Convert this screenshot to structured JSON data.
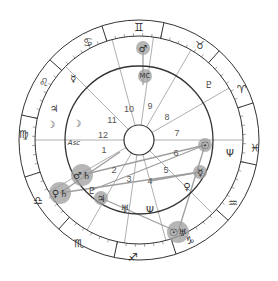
{
  "chart": {
    "center": [
      139,
      140
    ],
    "radii": {
      "outer": 120,
      "zodiac_inner": 104,
      "house": 74,
      "inner": 15
    },
    "colors": {
      "ring": "#333333",
      "house_line": "#9a9a9a",
      "aspect": "#9e9e9e",
      "highlight": "#9e9e9e",
      "glyph": "#333333"
    }
  },
  "zodiac": [
    {
      "name": "gemini",
      "glyph": "♊",
      "x": 139,
      "y": 27
    },
    {
      "name": "taurus",
      "glyph": "♉",
      "x": 200,
      "y": 45
    },
    {
      "name": "aries",
      "glyph": "♈",
      "x": 242,
      "y": 89
    },
    {
      "name": "pisces",
      "glyph": "♓",
      "x": 255,
      "y": 148
    },
    {
      "name": "aquarius",
      "glyph": "♒",
      "x": 233,
      "y": 203
    },
    {
      "name": "capricorn",
      "glyph": "♑",
      "x": 190,
      "y": 240
    },
    {
      "name": "sagittarius",
      "glyph": "♐",
      "x": 133,
      "y": 257
    },
    {
      "name": "scorpio",
      "glyph": "♏",
      "x": 79,
      "y": 243
    },
    {
      "name": "libra",
      "glyph": "♎",
      "x": 38,
      "y": 200
    },
    {
      "name": "virgo",
      "glyph": "♍",
      "x": 24,
      "y": 134
    },
    {
      "name": "leo",
      "glyph": "♌",
      "x": 44,
      "y": 82
    },
    {
      "name": "cancer",
      "glyph": "♋",
      "x": 88,
      "y": 42
    }
  ],
  "houses": [
    {
      "num": "1",
      "x": 104,
      "y": 150
    },
    {
      "num": "2",
      "x": 114,
      "y": 170
    },
    {
      "num": "3",
      "x": 129,
      "y": 179
    },
    {
      "num": "4",
      "x": 150,
      "y": 181
    },
    {
      "num": "5",
      "x": 166,
      "y": 170
    },
    {
      "num": "6",
      "x": 176,
      "y": 153
    },
    {
      "num": "7",
      "x": 177,
      "y": 133
    },
    {
      "num": "8",
      "x": 167,
      "y": 117
    },
    {
      "num": "9",
      "x": 150,
      "y": 106
    },
    {
      "num": "10",
      "x": 129,
      "y": 109
    },
    {
      "num": "11",
      "x": 112,
      "y": 120
    },
    {
      "num": "12",
      "x": 103,
      "y": 135
    }
  ],
  "planets": [
    {
      "name": "mars",
      "glyph": "♂",
      "x": 143,
      "y": 48,
      "highlight": true
    },
    {
      "name": "midheaven",
      "glyph": "MC",
      "x": 145,
      "y": 76,
      "highlight": true
    },
    {
      "name": "pluto-outer",
      "glyph": "♇",
      "x": 209,
      "y": 84,
      "highlight": false
    },
    {
      "name": "mercury-outer",
      "glyph": "☿",
      "x": 73,
      "y": 78,
      "highlight": false
    },
    {
      "name": "jupiter-outer",
      "glyph": "♃",
      "x": 54,
      "y": 108,
      "highlight": false
    },
    {
      "name": "moon-outer",
      "glyph": "☽",
      "x": 51,
      "y": 124,
      "highlight": false
    },
    {
      "name": "moon",
      "glyph": "☽",
      "x": 77,
      "y": 123,
      "highlight": false
    },
    {
      "name": "ascendant",
      "glyph": "Asc",
      "x": 74,
      "y": 143,
      "highlight": false
    },
    {
      "name": "sun",
      "glyph": "☉",
      "x": 205,
      "y": 145,
      "highlight": true
    },
    {
      "name": "neptune-outer",
      "glyph": "Ψ",
      "x": 230,
      "y": 153,
      "highlight": false
    },
    {
      "name": "mercury",
      "glyph": "☿",
      "x": 200,
      "y": 172,
      "highlight": true
    },
    {
      "name": "venus",
      "glyph": "♀",
      "x": 187,
      "y": 186,
      "highlight": false
    },
    {
      "name": "mars-saturn",
      "glyph": "♂♄",
      "x": 82,
      "y": 175,
      "highlight": true
    },
    {
      "name": "venus-saturn",
      "glyph": "♀♄",
      "x": 60,
      "y": 193,
      "highlight": true
    },
    {
      "name": "pluto",
      "glyph": "♇",
      "x": 92,
      "y": 190,
      "highlight": false
    },
    {
      "name": "jupiter",
      "glyph": "♃",
      "x": 101,
      "y": 198,
      "highlight": true
    },
    {
      "name": "uranus",
      "glyph": "♅",
      "x": 125,
      "y": 208,
      "highlight": false
    },
    {
      "name": "neptune",
      "glyph": "Ψ",
      "x": 150,
      "y": 210,
      "highlight": false
    },
    {
      "name": "sun-uranus",
      "glyph": "☉♅",
      "x": 178,
      "y": 232,
      "highlight": true
    }
  ],
  "aspects": [
    [
      143,
      48,
      143,
      85
    ],
    [
      200,
      172,
      60,
      193
    ],
    [
      200,
      172,
      150,
      181
    ],
    [
      205,
      145,
      178,
      232
    ],
    [
      82,
      175,
      205,
      145
    ],
    [
      101,
      198,
      178,
      232
    ],
    [
      60,
      193,
      120,
      152
    ],
    [
      92,
      190,
      205,
      145
    ]
  ],
  "house_cusps_deg": [
    180,
    210,
    240,
    262,
    285,
    315,
    0,
    30,
    60,
    82,
    105,
    135
  ]
}
